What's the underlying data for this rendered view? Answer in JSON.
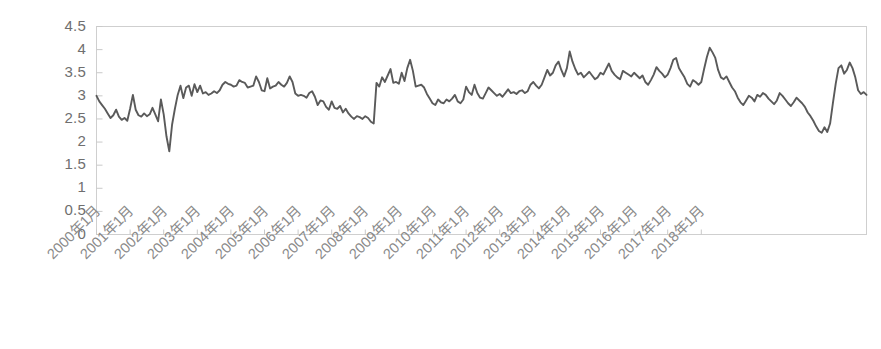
{
  "chart_data": {
    "type": "line",
    "title": "",
    "subtitle": "",
    "xlabel": "",
    "ylabel": "",
    "ylim": [
      0,
      4.5
    ],
    "grid": false,
    "legend": "none",
    "series_color": "#5a5a5a",
    "axis_color": "#c9c9c9",
    "ytick_labels": [
      "4.5",
      "4",
      "3.5",
      "3",
      "2.5",
      "2",
      "1.5",
      "1",
      "0.5",
      "0"
    ],
    "ytick_values": [
      4.5,
      4,
      3.5,
      3,
      2.5,
      2,
      1.5,
      1,
      0.5,
      0
    ],
    "xtick_labels": [
      "2000年1月",
      "2001年1月",
      "2002年1月",
      "2003年1月",
      "2004年1月",
      "2005年1月",
      "2006年1月",
      "2007年1月",
      "2008年1月",
      "2009年1月",
      "2010年1月",
      "2011年1月",
      "2012年1月",
      "2013年1月",
      "2014年1月",
      "2015年1月",
      "2016年1月",
      "2017年1月",
      "2018年1月"
    ],
    "x_start": "2000年1月",
    "x_end": "2018年12月",
    "x_step_months": 1,
    "values": [
      3.0,
      2.88,
      2.8,
      2.72,
      2.62,
      2.52,
      2.58,
      2.7,
      2.55,
      2.48,
      2.52,
      2.46,
      2.72,
      3.02,
      2.7,
      2.58,
      2.55,
      2.62,
      2.56,
      2.6,
      2.74,
      2.6,
      2.45,
      2.92,
      2.6,
      2.12,
      1.8,
      2.38,
      2.72,
      3.02,
      3.22,
      2.95,
      3.18,
      3.22,
      3.0,
      3.25,
      3.08,
      3.22,
      3.05,
      3.08,
      3.02,
      3.05,
      3.1,
      3.06,
      3.12,
      3.24,
      3.3,
      3.26,
      3.24,
      3.2,
      3.22,
      3.34,
      3.3,
      3.28,
      3.18,
      3.2,
      3.22,
      3.42,
      3.3,
      3.12,
      3.1,
      3.38,
      3.16,
      3.2,
      3.22,
      3.3,
      3.24,
      3.2,
      3.28,
      3.42,
      3.3,
      3.05,
      3.0,
      3.02,
      3.0,
      2.96,
      3.06,
      3.1,
      2.98,
      2.8,
      2.9,
      2.88,
      2.76,
      2.7,
      2.88,
      2.74,
      2.72,
      2.78,
      2.64,
      2.72,
      2.62,
      2.55,
      2.5,
      2.56,
      2.54,
      2.5,
      2.56,
      2.52,
      2.44,
      2.4,
      3.28,
      3.2,
      3.4,
      3.3,
      3.44,
      3.58,
      3.28,
      3.3,
      3.26,
      3.5,
      3.32,
      3.6,
      3.78,
      3.54,
      3.2,
      3.22,
      3.24,
      3.18,
      3.04,
      2.94,
      2.84,
      2.8,
      2.92,
      2.86,
      2.84,
      2.92,
      2.88,
      2.94,
      3.02,
      2.88,
      2.84,
      2.92,
      3.2,
      3.08,
      3.02,
      3.24,
      3.06,
      2.96,
      2.94,
      3.06,
      3.18,
      3.12,
      3.06,
      3.0,
      3.04,
      2.98,
      3.06,
      3.14,
      3.06,
      3.08,
      3.04,
      3.1,
      3.12,
      3.06,
      3.1,
      3.24,
      3.3,
      3.22,
      3.16,
      3.24,
      3.4,
      3.56,
      3.44,
      3.5,
      3.66,
      3.74,
      3.56,
      3.42,
      3.6,
      3.96,
      3.74,
      3.58,
      3.46,
      3.5,
      3.4,
      3.46,
      3.52,
      3.44,
      3.36,
      3.4,
      3.5,
      3.46,
      3.58,
      3.7,
      3.54,
      3.46,
      3.4,
      3.36,
      3.54,
      3.5,
      3.46,
      3.42,
      3.5,
      3.44,
      3.38,
      3.44,
      3.3,
      3.24,
      3.34,
      3.46,
      3.62,
      3.54,
      3.48,
      3.4,
      3.46,
      3.6,
      3.78,
      3.82,
      3.6,
      3.5,
      3.4,
      3.26,
      3.2,
      3.34,
      3.3,
      3.24,
      3.3,
      3.58,
      3.84,
      4.04,
      3.94,
      3.82,
      3.56,
      3.4,
      3.36,
      3.42,
      3.3,
      3.18,
      3.1,
      2.96,
      2.86,
      2.8,
      2.9,
      3.0,
      2.96,
      2.88,
      3.02,
      2.98,
      3.06,
      3.02,
      2.94,
      2.88,
      2.82,
      2.9,
      3.06,
      3.0,
      2.92,
      2.84,
      2.78,
      2.86,
      2.96,
      2.9,
      2.84,
      2.76,
      2.64,
      2.56,
      2.46,
      2.34,
      2.24,
      2.2,
      2.32,
      2.22,
      2.4,
      2.84,
      3.26,
      3.6,
      3.66,
      3.48,
      3.56,
      3.72,
      3.6,
      3.4,
      3.12,
      3.04,
      3.08,
      3.02
    ]
  }
}
